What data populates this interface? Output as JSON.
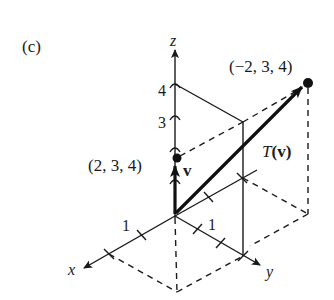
{
  "figure": {
    "panel_label": "(c)",
    "axes": {
      "x_label": "x",
      "y_label": "y",
      "z_label": "z",
      "x_tick_label": "1",
      "y_tick_label": "1",
      "z_tick_labels": [
        "3",
        "4"
      ]
    },
    "vectors": [
      {
        "name": "v",
        "label": "v",
        "point": [
          2,
          3,
          4
        ],
        "point_label": "(2, 3, 4)"
      },
      {
        "name": "T(v)",
        "label_prefix": "T",
        "label_arg": "(v)",
        "point": [
          -2,
          3,
          4
        ],
        "point_label": "(−2, 3, 4)"
      }
    ],
    "colors": {
      "ink": "#1a1a1a",
      "background": "#ffffff"
    }
  }
}
